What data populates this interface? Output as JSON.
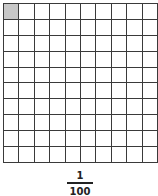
{
  "grid": {
    "rows": 10,
    "columns": 10,
    "shaded_cells": [
      [
        0,
        0
      ]
    ],
    "shaded_color": "#c8c8c8",
    "line_color": "#3a3a3a"
  },
  "fraction": {
    "numerator": "1",
    "denominator": "100"
  }
}
